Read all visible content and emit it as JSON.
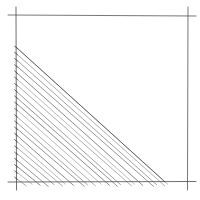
{
  "figure": {
    "stroke_color": "#3a3a3a",
    "frame_color": "#4a4a4a",
    "hatch_color": "#555555",
    "frame": {
      "top_y": 15,
      "bottom_y": 182,
      "left_x": 16,
      "right_x": 188,
      "overshoot": 8
    },
    "triangle": {
      "apex": [
        16,
        47
      ],
      "right_angle": [
        16,
        182
      ],
      "base_end": [
        165,
        182
      ]
    },
    "hatch": {
      "count": 22,
      "overshoot_bottom": 6
    }
  }
}
